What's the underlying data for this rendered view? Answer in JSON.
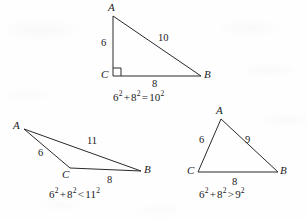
{
  "figure": {
    "stroke_color": "#2a2a2a",
    "background_color": "#fefefe"
  },
  "triangles": [
    {
      "id": "right-triangle",
      "kind": "right",
      "has_right_angle_mark": true,
      "vertices": {
        "A": {
          "label": "A",
          "x": 113,
          "y": 16
        },
        "B": {
          "label": "B",
          "x": 201,
          "y": 76
        },
        "C": {
          "label": "C",
          "x": 113,
          "y": 76
        }
      },
      "sides": {
        "leg_vertical": "6",
        "leg_horizontal": "8",
        "hypotenuse": "10"
      },
      "equation": {
        "a": "6",
        "a_exp": "2",
        "op1": "+",
        "b": "8",
        "b_exp": "2",
        "relation": "=",
        "c": "10",
        "c_exp": "2",
        "text": "6² + 8² = 10²"
      }
    },
    {
      "id": "obtuse-triangle",
      "kind": "obtuse",
      "has_right_angle_mark": false,
      "vertices": {
        "A": {
          "label": "A",
          "x": 24,
          "y": 129
        },
        "B": {
          "label": "B",
          "x": 141,
          "y": 171
        },
        "C": {
          "label": "C",
          "x": 70,
          "y": 168
        }
      },
      "sides": {
        "leg_vertical": "6",
        "leg_horizontal": "8",
        "hypotenuse": "11"
      },
      "equation": {
        "a": "6",
        "a_exp": "2",
        "op1": "+",
        "b": "8",
        "b_exp": "2",
        "relation": "<",
        "c": "11",
        "c_exp": "2",
        "text": "6² + 8² < 11²"
      }
    },
    {
      "id": "acute-triangle",
      "kind": "acute",
      "has_right_angle_mark": false,
      "vertices": {
        "A": {
          "label": "A",
          "x": 221,
          "y": 119
        },
        "B": {
          "label": "B",
          "x": 278,
          "y": 172
        },
        "C": {
          "label": "C",
          "x": 198,
          "y": 172
        }
      },
      "sides": {
        "leg_vertical": "6",
        "leg_horizontal": "8",
        "hypotenuse": "9"
      },
      "equation": {
        "a": "6",
        "a_exp": "2",
        "op1": "+",
        "b": "8",
        "b_exp": "2",
        "relation": ">",
        "c": "9",
        "c_exp": "2",
        "text": "6² + 8² > 9²"
      }
    }
  ]
}
